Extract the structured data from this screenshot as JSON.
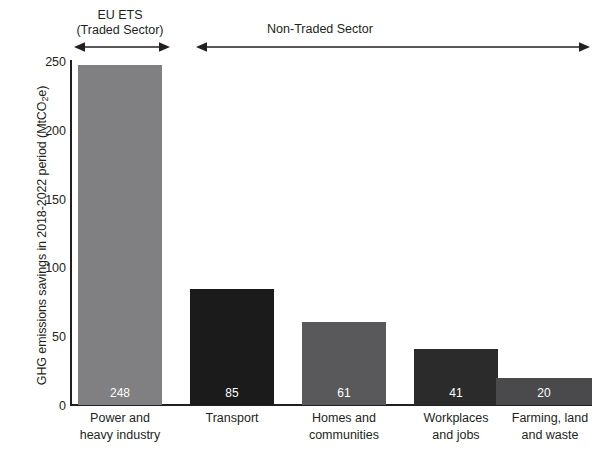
{
  "chart_data": {
    "type": "bar",
    "title": "",
    "xlabel": "",
    "ylabel": "GHG emissions savings in 2018-2022 period (MtCO₂e)",
    "ylabel_main": "GHG emissions savings in 2018-2022 period (MtCO",
    "ylabel_sub": "2",
    "ylabel_tail": "e)",
    "categories": [
      "Power and heavy industry",
      "Transport",
      "Homes and communities",
      "Workplaces and jobs",
      "Farming, land and waste"
    ],
    "category_lines": [
      [
        "Power and",
        "heavy industry"
      ],
      [
        "Transport",
        ""
      ],
      [
        "Homes and",
        "communities"
      ],
      [
        "Workplaces",
        "and jobs"
      ],
      [
        "Farming, land",
        "and waste"
      ]
    ],
    "values": [
      248,
      85,
      61,
      41,
      20
    ],
    "value_labels": [
      "248",
      "85",
      "61",
      "41",
      "20"
    ],
    "bar_colors": [
      "#808082",
      "#1b1b1c",
      "#59595b",
      "#2b2b2c",
      "#4a4a4c"
    ],
    "ylim": [
      0,
      252
    ],
    "yticks": [
      0,
      50,
      100,
      150,
      200,
      250
    ],
    "ytick_labels": [
      "0",
      "50",
      "100",
      "150",
      "200",
      "250"
    ],
    "grid": false,
    "legend": "none"
  },
  "annotations": {
    "traded": {
      "line1": "EU ETS",
      "line2": "(Traded Sector)",
      "arrow": "double-headed-arrow"
    },
    "non_traded": {
      "line1": "Non-Traded Sector",
      "arrow": "double-headed-arrow"
    }
  },
  "colors": {
    "axis": "#231f20",
    "text": "#231f20",
    "value_label": "#ffffff",
    "background": "#ffffff"
  }
}
